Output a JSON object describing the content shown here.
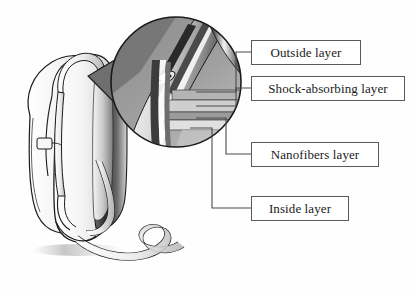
{
  "figure": {
    "kind": "technical-illustration",
    "style": "grayscale pen-and-ink shaded drawing",
    "background_color": "#fefefe",
    "line_color": "#1b1b1b",
    "shade_dark": "#3c3c3c",
    "shade_mid": "#8e8e8e",
    "shade_light": "#d2d2d2",
    "magnifier": {
      "name": "magnified-circle",
      "center_x": 176,
      "center_y": 82,
      "radius": 65
    }
  },
  "labels": {
    "box_border_color": "#5a5a5a",
    "leader_color": "#4a4a4a",
    "items": [
      {
        "id": "outside",
        "text": "Outside layer"
      },
      {
        "id": "shock",
        "text": "Shock-absorbing layer"
      },
      {
        "id": "nanofibers",
        "text": "Nanofibers layer"
      },
      {
        "id": "inside",
        "text": "Inside layer"
      }
    ]
  }
}
